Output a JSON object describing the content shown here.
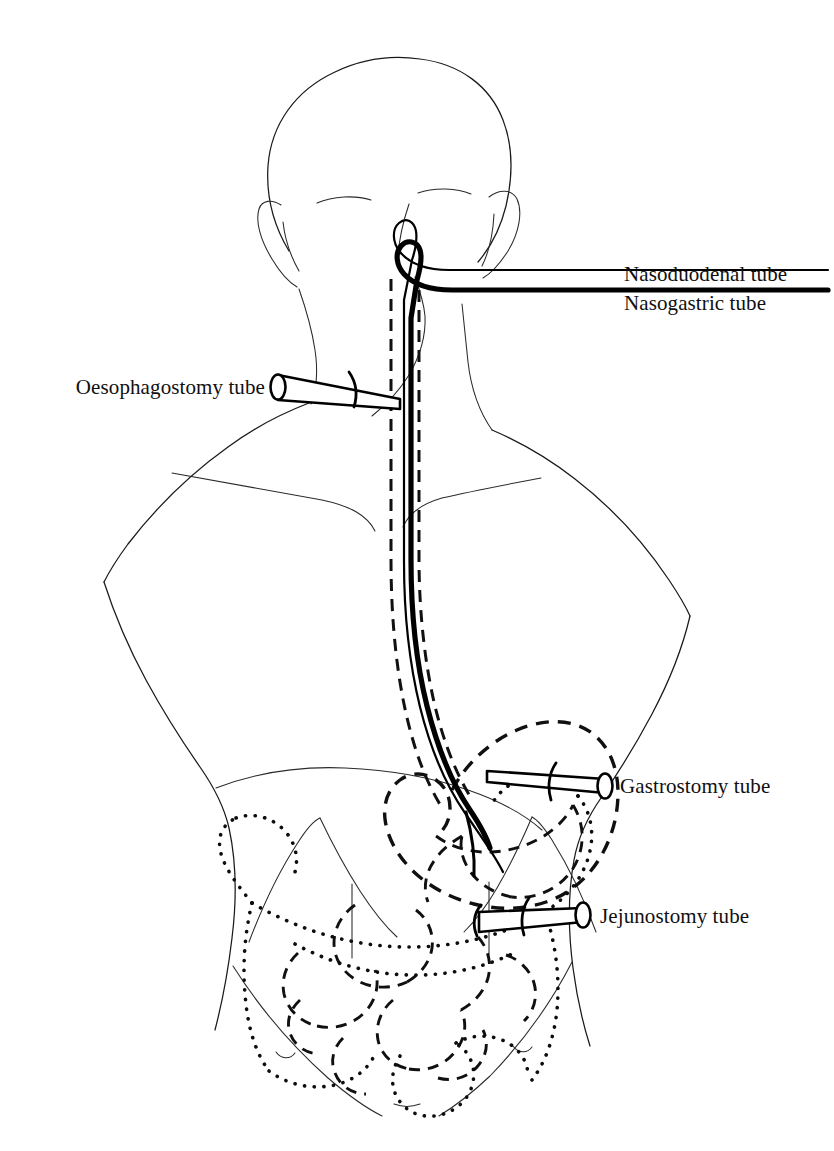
{
  "figure": {
    "background_color": "#ffffff",
    "ink_color": "#101010",
    "width": 834,
    "height": 1151,
    "view": "anterior torso line drawing"
  },
  "labels": {
    "nasoduodenal": "Nasoduodenal tube",
    "nasogastric": "Nasogastric tube",
    "oesophagostomy": "Oesophagostomy tube",
    "gastrostomy": "Gastrostomy tube",
    "jejunostomy": "Jejunostomy tube"
  },
  "legend_line_styles": {
    "nasoduodenal_leader": "thin solid",
    "nasogastric_leader": "thick solid",
    "oesophagus_wall": "dashed",
    "stomach_and_small_bowel": "dashed",
    "large_bowel_colon": "dotted",
    "body_outline": "fine solid"
  },
  "anatomy": {
    "items": [
      "head",
      "ears",
      "eyebrows",
      "nose",
      "neck",
      "shoulders",
      "clavicles",
      "chest",
      "nipples",
      "abdomen",
      "inguinal-creases",
      "oesophagus",
      "stomach",
      "duodenum",
      "jejunum",
      "small-intestine",
      "large-intestine",
      "sigmoid-colon"
    ]
  },
  "tubes": [
    {
      "id": "nasoduodenal",
      "label": "Nasoduodenal tube",
      "entry": "nose",
      "terminus": "duodenum",
      "line_style": "thin solid",
      "label_position": "right"
    },
    {
      "id": "nasogastric",
      "label": "Nasogastric tube",
      "entry": "nose",
      "terminus": "stomach",
      "line_style": "thick solid",
      "label_position": "right"
    },
    {
      "id": "oesophagostomy",
      "label": "Oesophagostomy tube",
      "entry": "neck",
      "terminus": "oesophagus",
      "line_style": "cone with open end",
      "label_position": "left"
    },
    {
      "id": "gastrostomy",
      "label": "Gastrostomy tube",
      "entry": "abdominal wall",
      "terminus": "stomach",
      "line_style": "cone with open end",
      "label_position": "right"
    },
    {
      "id": "jejunostomy",
      "label": "Jejunostomy tube",
      "entry": "abdominal wall",
      "terminus": "jejunum",
      "line_style": "cone with open end",
      "label_position": "right"
    }
  ]
}
